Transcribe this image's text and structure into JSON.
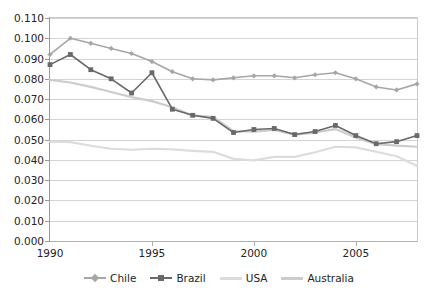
{
  "chart_data": {
    "type": "line",
    "title": "",
    "xlabel": "",
    "ylabel": "",
    "x": [
      1990,
      1991,
      1992,
      1993,
      1994,
      1995,
      1996,
      1997,
      1998,
      1999,
      2000,
      2001,
      2002,
      2003,
      2004,
      2005,
      2006,
      2007,
      2008
    ],
    "xlim": [
      1990,
      2008
    ],
    "ylim": [
      0.0,
      0.11
    ],
    "ytick_labels": [
      "0.000",
      "0.010",
      "0.020",
      "0.030",
      "0.040",
      "0.050",
      "0.060",
      "0.070",
      "0.080",
      "0.090",
      "0.100",
      "0.110"
    ],
    "ytick_values": [
      0.0,
      0.01,
      0.02,
      0.03,
      0.04,
      0.05,
      0.06,
      0.07,
      0.08,
      0.09,
      0.1,
      0.11
    ],
    "xtick_labels": [
      "1990",
      "1995",
      "2000",
      "2005"
    ],
    "xtick_values": [
      1990,
      1995,
      2000,
      2005
    ],
    "grid": true,
    "legend_position": "bottom",
    "series": [
      {
        "name": "Chile",
        "color": "#a6a6a6",
        "marker": "diamond",
        "values": [
          0.092,
          0.1,
          0.0975,
          0.095,
          0.0925,
          0.0885,
          0.0835,
          0.08,
          0.0795,
          0.0805,
          0.0815,
          0.0815,
          0.0805,
          0.082,
          0.083,
          0.08,
          0.076,
          0.0745,
          0.0775
        ]
      },
      {
        "name": "Brazil",
        "color": "#696969",
        "marker": "square",
        "values": [
          0.087,
          0.092,
          0.0845,
          0.08,
          0.073,
          0.083,
          0.065,
          0.062,
          0.0605,
          0.0535,
          0.055,
          0.0555,
          0.0525,
          0.054,
          0.057,
          0.052,
          0.048,
          0.049,
          0.052
        ]
      },
      {
        "name": "USA",
        "color": "#dcdcdc",
        "marker": "none",
        "values": [
          0.049,
          0.0488,
          0.047,
          0.0455,
          0.045,
          0.0455,
          0.0452,
          0.0445,
          0.044,
          0.0405,
          0.0398,
          0.0415,
          0.0415,
          0.0438,
          0.0465,
          0.0462,
          0.044,
          0.0418,
          0.037
        ]
      },
      {
        "name": "Australia",
        "color": "#cccccc",
        "marker": "none",
        "values": [
          0.0795,
          0.0782,
          0.076,
          0.0735,
          0.071,
          0.069,
          0.066,
          0.0618,
          0.0612,
          0.0542,
          0.054,
          0.0548,
          0.0525,
          0.0535,
          0.0552,
          0.051,
          0.0478,
          0.047,
          0.0465
        ]
      }
    ]
  },
  "legend": {
    "items": [
      {
        "label": "Chile"
      },
      {
        "label": "Brazil"
      },
      {
        "label": "USA"
      },
      {
        "label": "Australia"
      }
    ]
  }
}
